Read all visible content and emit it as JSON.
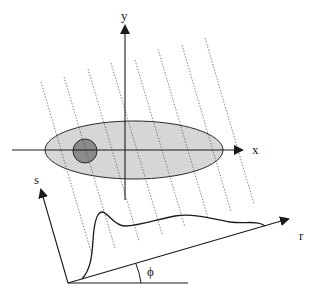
{
  "diagram": {
    "type": "projection-geometry",
    "colors": {
      "axis": "#1a1a1a",
      "ellipse_fill": "#d6d6d6",
      "ellipse_stroke": "#2a2a2a",
      "circle_fill": "#8a8a8a",
      "ray": "#555555",
      "profile": "#1a1a1a",
      "background": "#ffffff"
    },
    "labels": {
      "x_axis": "x",
      "y_axis": "y",
      "s_axis": "s",
      "r_axis": "r",
      "angle": "ϕ"
    },
    "object": {
      "ellipse": {
        "cx": 134,
        "cy": 150,
        "rx": 89,
        "ry": 29
      },
      "inner_circle": {
        "cx": 85,
        "cy": 151,
        "r": 12
      }
    },
    "ray_count": 8,
    "components": [
      "Cartesian x-y axes",
      "Gray elliptical object with darker circular inclusion",
      "Parallel dotted projection rays",
      "Rotated s-r projection coordinate frame at angle ϕ",
      "Projection profile curve along r axis"
    ]
  }
}
